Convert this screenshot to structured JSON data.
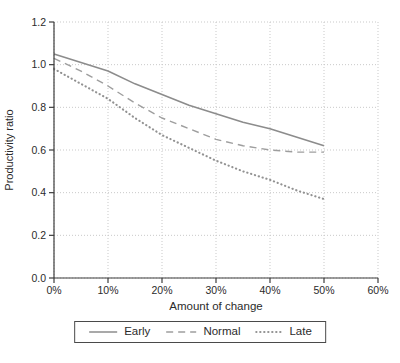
{
  "chart_data": {
    "type": "line",
    "x": [
      0,
      5,
      10,
      15,
      20,
      25,
      30,
      35,
      40,
      45,
      50
    ],
    "x_unit": "%",
    "series": [
      {
        "name": "Early",
        "line_style": "solid",
        "color": "#8c8c8c",
        "values": [
          1.05,
          1.01,
          0.97,
          0.91,
          0.86,
          0.81,
          0.77,
          0.73,
          0.7,
          0.66,
          0.62
        ]
      },
      {
        "name": "Normal",
        "line_style": "dashed",
        "color": "#9e9e9e",
        "values": [
          1.03,
          0.97,
          0.9,
          0.82,
          0.75,
          0.7,
          0.65,
          0.62,
          0.6,
          0.59,
          0.59
        ]
      },
      {
        "name": "Late",
        "line_style": "dotted",
        "color": "#929292",
        "values": [
          0.98,
          0.91,
          0.84,
          0.75,
          0.67,
          0.61,
          0.55,
          0.5,
          0.46,
          0.41,
          0.37
        ]
      }
    ],
    "title": "",
    "xlabel": "Amount of change",
    "ylabel": "Productivity ratio",
    "xlim": [
      0,
      60
    ],
    "ylim": [
      0.0,
      1.2
    ],
    "xticks": {
      "values": [
        0,
        10,
        20,
        30,
        40,
        50,
        60
      ],
      "labels": [
        "0%",
        "10%",
        "20%",
        "30%",
        "40%",
        "50%",
        "60%"
      ]
    },
    "yticks": {
      "values": [
        0.0,
        0.2,
        0.4,
        0.6,
        0.8,
        1.0,
        1.2
      ],
      "labels": [
        "0.0",
        "0.2",
        "0.4",
        "0.6",
        "0.8",
        "1.0",
        "1.2"
      ]
    },
    "grid": "dotted",
    "legend_position": "bottom",
    "colors": {
      "grid": "#c9c9c9",
      "axis": "#3d3d3d",
      "text": "#2b2b2b",
      "background": "#ffffff"
    }
  }
}
